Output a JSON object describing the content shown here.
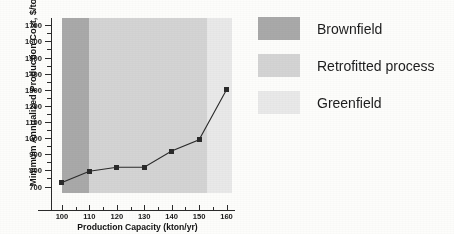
{
  "chart_data": {
    "type": "line",
    "title": "",
    "xlabel": "Production Capacity (kton/yr)",
    "ylabel": "Minimum Annualized Production Cost, $/ton",
    "x": [
      100,
      110,
      120,
      130,
      140,
      150,
      160
    ],
    "values": [
      725,
      795,
      820,
      820,
      920,
      990,
      1300
    ],
    "series": [
      {
        "name": "Minimum Annualized Production Cost",
        "values": [
          725,
          795,
          820,
          820,
          920,
          990,
          1300
        ],
        "marker": "square",
        "color": "#2a2a2a"
      }
    ],
    "xlim": [
      96,
      162
    ],
    "ylim": [
      660,
      1745
    ],
    "xticks": [
      100,
      110,
      120,
      130,
      140,
      150,
      160
    ],
    "yticks": [
      700,
      800,
      900,
      1000,
      1100,
      1200,
      1300,
      1400,
      1500,
      1600,
      1700
    ],
    "grid": false,
    "legend_position": "right",
    "bands": [
      {
        "label": "Brownfield",
        "x_start": 100,
        "x_end": 110,
        "color": "#a9a9a9"
      },
      {
        "label": "Retrofitted process",
        "x_start": 110,
        "x_end": 153,
        "color": "#d4d4d4"
      },
      {
        "label": "Greenfield",
        "x_start": 153,
        "x_end": 162,
        "color": "#e9e9e9"
      }
    ],
    "legend": [
      {
        "label": "Brownfield",
        "color": "#a9a9a9"
      },
      {
        "label": "Retrofitted process",
        "color": "#d4d4d4"
      },
      {
        "label": "Greenfield",
        "color": "#e9e9e9"
      }
    ]
  }
}
